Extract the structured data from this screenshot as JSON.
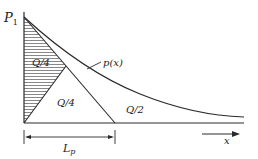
{
  "diagram": {
    "labels": {
      "p1_main": "P",
      "p1_sub": "1",
      "curve": "p(x)",
      "hatched_region": "Q/4",
      "middle_region": "Q/4",
      "tail_region": "Q/2",
      "x_axis": "x",
      "length_main": "L",
      "length_sub": "p"
    },
    "colors": {
      "line": "#2a2a2a",
      "hatch": "#555555",
      "background": "#ffffff"
    }
  }
}
